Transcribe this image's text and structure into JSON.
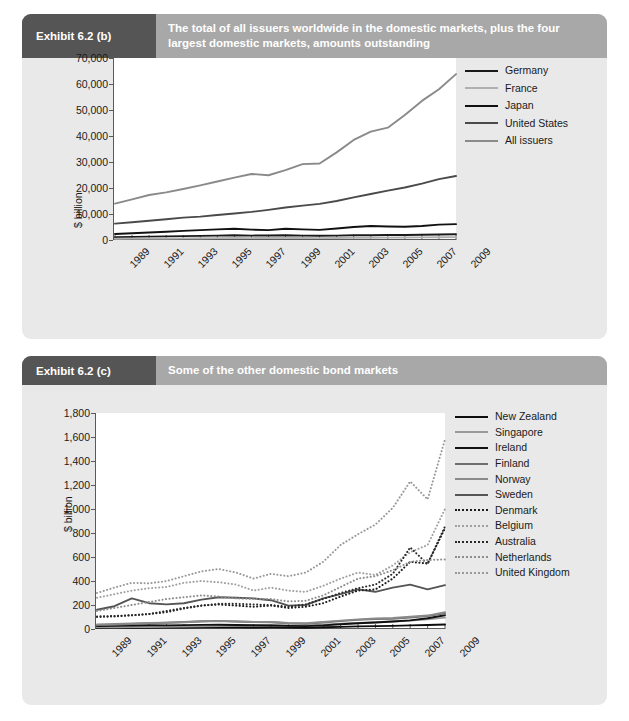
{
  "exhibits": [
    {
      "tag": "Exhibit 6.2 (b)",
      "title": "The total of all issuers worldwide in the domestic markets, plus the four largest domestic markets, amounts outstanding"
    },
    {
      "tag": "Exhibit 6.2 (c)",
      "title": "Some of the other domestic bond markets"
    }
  ],
  "chart_data": [
    {
      "type": "line",
      "title": "The total of all issuers worldwide in the domestic markets, plus the four largest domestic markets, amounts outstanding",
      "xlabel": "",
      "ylabel": "$ billion",
      "x": [
        1989,
        1990,
        1991,
        1992,
        1993,
        1994,
        1995,
        1996,
        1997,
        1998,
        1999,
        2000,
        2001,
        2002,
        2003,
        2004,
        2005,
        2006,
        2007,
        2008,
        2009
      ],
      "xtick_labels": [
        "1989",
        "1991",
        "1993",
        "1995",
        "1997",
        "1999",
        "2001",
        "2003",
        "2005",
        "2007",
        "2009"
      ],
      "ytick_labels": [
        "0",
        "10,000",
        "20,000",
        "30,000",
        "40,000",
        "50,000",
        "60,000",
        "70,000"
      ],
      "ylim": [
        0,
        70000
      ],
      "ystep": 10000,
      "grid": false,
      "legend_position": "right",
      "series": [
        {
          "name": "Germany",
          "color": "#1a1a1a",
          "style": "solid",
          "values": [
            1100,
            1200,
            1300,
            1400,
            1500,
            1600,
            1700,
            1800,
            1700,
            1750,
            1800,
            1700,
            1650,
            1700,
            1800,
            1850,
            1900,
            1950,
            2000,
            2100,
            2200
          ]
        },
        {
          "name": "France",
          "color": "#b0b0b0",
          "style": "solid",
          "values": [
            500,
            530,
            560,
            600,
            640,
            680,
            720,
            760,
            740,
            760,
            780,
            760,
            740,
            780,
            820,
            860,
            900,
            950,
            1000,
            1050,
            1100
          ]
        },
        {
          "name": "Japan",
          "color": "#111111",
          "style": "solid",
          "values": [
            2300,
            2600,
            2900,
            3200,
            3500,
            3800,
            4100,
            4300,
            4000,
            3800,
            4300,
            4100,
            3900,
            4400,
            5000,
            5400,
            5200,
            5100,
            5400,
            5900,
            6100
          ]
        },
        {
          "name": "United States",
          "color": "#4a4a4a",
          "style": "solid",
          "values": [
            6300,
            6800,
            7400,
            8000,
            8600,
            9000,
            9600,
            10200,
            10800,
            11600,
            12500,
            13200,
            13900,
            15000,
            16400,
            17700,
            19000,
            20200,
            21700,
            23400,
            24600
          ]
        },
        {
          "name": "All issuers",
          "color": "#8a8a8a",
          "style": "solid",
          "values": [
            14000,
            15600,
            17300,
            18300,
            19600,
            21000,
            22500,
            24000,
            25400,
            24900,
            26900,
            29200,
            29400,
            33700,
            38500,
            41700,
            43200,
            48100,
            53500,
            58000,
            63800
          ]
        }
      ]
    },
    {
      "type": "line",
      "title": "Some of the other domestic bond markets",
      "xlabel": "",
      "ylabel": "$ billion",
      "x": [
        1989,
        1990,
        1991,
        1992,
        1993,
        1994,
        1995,
        1996,
        1997,
        1998,
        1999,
        2000,
        2001,
        2002,
        2003,
        2004,
        2005,
        2006,
        2007,
        2008,
        2009
      ],
      "xtick_labels": [
        "1989",
        "1991",
        "1993",
        "1995",
        "1997",
        "1999",
        "2001",
        "2003",
        "2005",
        "2007",
        "2009"
      ],
      "ytick_labels": [
        "0",
        "200",
        "400",
        "600",
        "800",
        "1,000",
        "1,200",
        "1,400",
        "1,600",
        "1,800"
      ],
      "ylim": [
        0,
        1800
      ],
      "ystep": 200,
      "grid": false,
      "legend_position": "right",
      "series": [
        {
          "name": "New Zealand",
          "color": "#0d0d0d",
          "style": "solid",
          "values": [
            8,
            9,
            10,
            11,
            12,
            13,
            14,
            15,
            14,
            13,
            14,
            12,
            11,
            14,
            18,
            22,
            24,
            26,
            30,
            33,
            38
          ]
        },
        {
          "name": "Singapore",
          "color": "#9a9a9a",
          "style": "solid",
          "values": [
            14,
            15,
            16,
            17,
            18,
            20,
            22,
            24,
            26,
            28,
            32,
            30,
            29,
            36,
            44,
            50,
            56,
            62,
            70,
            80,
            95
          ]
        },
        {
          "name": "Ireland",
          "color": "#111111",
          "style": "solid",
          "values": [
            25,
            27,
            29,
            31,
            30,
            32,
            34,
            36,
            33,
            31,
            30,
            26,
            24,
            30,
            40,
            48,
            54,
            62,
            72,
            90,
            115
          ]
        },
        {
          "name": "Finland",
          "color": "#6e6e6e",
          "style": "solid",
          "values": [
            32,
            36,
            42,
            48,
            52,
            58,
            64,
            68,
            62,
            58,
            56,
            48,
            44,
            54,
            66,
            76,
            82,
            86,
            96,
            108,
            130
          ]
        },
        {
          "name": "Norway",
          "color": "#8a8a8a",
          "style": "solid",
          "values": [
            38,
            42,
            46,
            50,
            52,
            56,
            62,
            66,
            62,
            58,
            58,
            50,
            48,
            58,
            70,
            80,
            88,
            92,
            102,
            112,
            140
          ]
        },
        {
          "name": "Sweden",
          "color": "#555555",
          "style": "solid",
          "values": [
            160,
            190,
            255,
            215,
            205,
            215,
            245,
            265,
            260,
            255,
            240,
            195,
            200,
            255,
            290,
            330,
            310,
            345,
            370,
            330,
            365
          ]
        },
        {
          "name": "Denmark",
          "color": "#1a1a1a",
          "style": "dotted",
          "values": [
            105,
            108,
            115,
            125,
            150,
            175,
            195,
            205,
            195,
            185,
            195,
            175,
            185,
            215,
            270,
            320,
            330,
            420,
            560,
            545,
            840
          ]
        },
        {
          "name": "Belgium",
          "color": "#a0a0a0",
          "style": "dotted",
          "values": [
            260,
            290,
            320,
            340,
            350,
            385,
            400,
            390,
            370,
            320,
            345,
            320,
            310,
            360,
            420,
            470,
            450,
            530,
            640,
            700,
            1000
          ]
        },
        {
          "name": "Australia",
          "color": "#2a2a2a",
          "style": "dotted",
          "values": [
            100,
            105,
            115,
            125,
            140,
            170,
            195,
            210,
            210,
            205,
            200,
            185,
            205,
            250,
            300,
            340,
            370,
            460,
            680,
            540,
            855
          ]
        },
        {
          "name": "Netherlands",
          "color": "#8d8d8d",
          "style": "dotted",
          "values": [
            150,
            175,
            200,
            225,
            250,
            265,
            280,
            270,
            255,
            250,
            250,
            230,
            235,
            280,
            350,
            420,
            440,
            490,
            560,
            575,
            580
          ]
        },
        {
          "name": "United Kingdom",
          "color": "#999999",
          "style": "dotted",
          "values": [
            300,
            345,
            385,
            380,
            400,
            440,
            480,
            500,
            470,
            420,
            460,
            440,
            470,
            560,
            700,
            790,
            870,
            1010,
            1230,
            1080,
            1580
          ]
        }
      ]
    }
  ]
}
